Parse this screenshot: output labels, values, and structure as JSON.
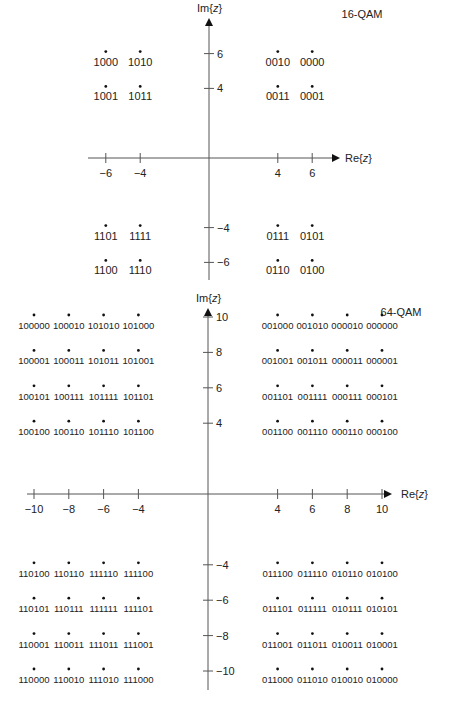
{
  "chart_data": [
    {
      "type": "scatter",
      "title": "16-QAM",
      "xlabel": "Re{z}",
      "ylabel": "Im{z}",
      "x_ticks": [
        -6,
        -4,
        4,
        6
      ],
      "y_ticks": [
        6,
        4,
        -4,
        -6
      ],
      "grid": false,
      "points": [
        {
          "x": -6,
          "y": 6,
          "label": "1000"
        },
        {
          "x": -4,
          "y": 6,
          "label": "1010"
        },
        {
          "x": 4,
          "y": 6,
          "label": "0010"
        },
        {
          "x": 6,
          "y": 6,
          "label": "0000"
        },
        {
          "x": -6,
          "y": 4,
          "label": "1001"
        },
        {
          "x": -4,
          "y": 4,
          "label": "1011"
        },
        {
          "x": 4,
          "y": 4,
          "label": "0011"
        },
        {
          "x": 6,
          "y": 4,
          "label": "0001"
        },
        {
          "x": -6,
          "y": -4,
          "label": "1101"
        },
        {
          "x": -4,
          "y": -4,
          "label": "1111"
        },
        {
          "x": 4,
          "y": -4,
          "label": "0111"
        },
        {
          "x": 6,
          "y": -4,
          "label": "0101"
        },
        {
          "x": -6,
          "y": -6,
          "label": "1100"
        },
        {
          "x": -4,
          "y": -6,
          "label": "1110"
        },
        {
          "x": 4,
          "y": -6,
          "label": "0110"
        },
        {
          "x": 6,
          "y": -6,
          "label": "0100"
        }
      ]
    },
    {
      "type": "scatter",
      "title": "64-QAM",
      "xlabel": "Re{z}",
      "ylabel": "Im{z}",
      "x_ticks": [
        -10,
        -8,
        -6,
        -4,
        4,
        6,
        8,
        10
      ],
      "y_ticks": [
        10,
        8,
        6,
        4,
        -4,
        -6,
        -8,
        -10
      ],
      "grid": false,
      "points": [
        {
          "x": -10,
          "y": 10,
          "label": "100000"
        },
        {
          "x": -8,
          "y": 10,
          "label": "100010"
        },
        {
          "x": -6,
          "y": 10,
          "label": "101010"
        },
        {
          "x": -4,
          "y": 10,
          "label": "101000"
        },
        {
          "x": 4,
          "y": 10,
          "label": "001000"
        },
        {
          "x": 6,
          "y": 10,
          "label": "001010"
        },
        {
          "x": 8,
          "y": 10,
          "label": "000010"
        },
        {
          "x": 10,
          "y": 10,
          "label": "000000"
        },
        {
          "x": -10,
          "y": 8,
          "label": "100001"
        },
        {
          "x": -8,
          "y": 8,
          "label": "100011"
        },
        {
          "x": -6,
          "y": 8,
          "label": "101011"
        },
        {
          "x": -4,
          "y": 8,
          "label": "101001"
        },
        {
          "x": 4,
          "y": 8,
          "label": "001001"
        },
        {
          "x": 6,
          "y": 8,
          "label": "001011"
        },
        {
          "x": 8,
          "y": 8,
          "label": "000011"
        },
        {
          "x": 10,
          "y": 8,
          "label": "000001"
        },
        {
          "x": -10,
          "y": 6,
          "label": "100101"
        },
        {
          "x": -8,
          "y": 6,
          "label": "100111"
        },
        {
          "x": -6,
          "y": 6,
          "label": "101111"
        },
        {
          "x": -4,
          "y": 6,
          "label": "101101"
        },
        {
          "x": 4,
          "y": 6,
          "label": "001101"
        },
        {
          "x": 6,
          "y": 6,
          "label": "001111"
        },
        {
          "x": 8,
          "y": 6,
          "label": "000111"
        },
        {
          "x": 10,
          "y": 6,
          "label": "000101"
        },
        {
          "x": -10,
          "y": 4,
          "label": "100100"
        },
        {
          "x": -8,
          "y": 4,
          "label": "100110"
        },
        {
          "x": -6,
          "y": 4,
          "label": "101110"
        },
        {
          "x": -4,
          "y": 4,
          "label": "101100"
        },
        {
          "x": 4,
          "y": 4,
          "label": "001100"
        },
        {
          "x": 6,
          "y": 4,
          "label": "001110"
        },
        {
          "x": 8,
          "y": 4,
          "label": "000110"
        },
        {
          "x": 10,
          "y": 4,
          "label": "000100"
        },
        {
          "x": -10,
          "y": -4,
          "label": "110100"
        },
        {
          "x": -8,
          "y": -4,
          "label": "110110"
        },
        {
          "x": -6,
          "y": -4,
          "label": "111110"
        },
        {
          "x": -4,
          "y": -4,
          "label": "111100"
        },
        {
          "x": 4,
          "y": -4,
          "label": "011100"
        },
        {
          "x": 6,
          "y": -4,
          "label": "011110"
        },
        {
          "x": 8,
          "y": -4,
          "label": "010110"
        },
        {
          "x": 10,
          "y": -4,
          "label": "010100"
        },
        {
          "x": -10,
          "y": -6,
          "label": "110101"
        },
        {
          "x": -8,
          "y": -6,
          "label": "110111"
        },
        {
          "x": -6,
          "y": -6,
          "label": "111111"
        },
        {
          "x": -4,
          "y": -6,
          "label": "111101"
        },
        {
          "x": 4,
          "y": -6,
          "label": "011101"
        },
        {
          "x": 6,
          "y": -6,
          "label": "011111"
        },
        {
          "x": 8,
          "y": -6,
          "label": "010111"
        },
        {
          "x": 10,
          "y": -6,
          "label": "010101"
        },
        {
          "x": -10,
          "y": -8,
          "label": "110001"
        },
        {
          "x": -8,
          "y": -8,
          "label": "110011"
        },
        {
          "x": -6,
          "y": -8,
          "label": "111011"
        },
        {
          "x": -4,
          "y": -8,
          "label": "111001"
        },
        {
          "x": 4,
          "y": -8,
          "label": "011001"
        },
        {
          "x": 6,
          "y": -8,
          "label": "011011"
        },
        {
          "x": 8,
          "y": -8,
          "label": "010011"
        },
        {
          "x": 10,
          "y": -8,
          "label": "010001"
        },
        {
          "x": -10,
          "y": -10,
          "label": "110000"
        },
        {
          "x": -8,
          "y": -10,
          "label": "110010"
        },
        {
          "x": -6,
          "y": -10,
          "label": "111010"
        },
        {
          "x": -4,
          "y": -10,
          "label": "111000"
        },
        {
          "x": 4,
          "y": -10,
          "label": "011000"
        },
        {
          "x": 6,
          "y": -10,
          "label": "011010"
        },
        {
          "x": 8,
          "y": -10,
          "label": "010010"
        },
        {
          "x": 10,
          "y": -10,
          "label": "010000"
        }
      ]
    }
  ],
  "colors": {
    "axis": "#555555",
    "point": "#111111",
    "text": "#222222"
  }
}
